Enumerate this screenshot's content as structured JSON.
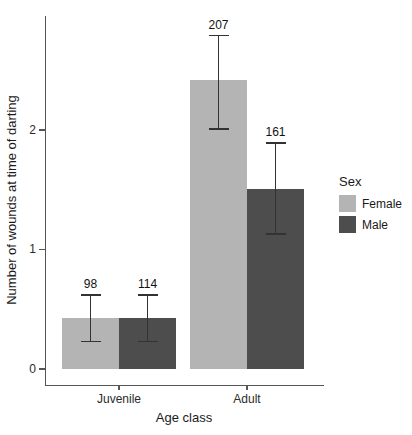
{
  "figure": {
    "width": 412,
    "height": 435,
    "background": "#ffffff"
  },
  "colors": {
    "female_bar": "#b4b4b4",
    "male_bar": "#4d4d4d",
    "axis": "#555555",
    "error_bar": "#333333",
    "text": "#1a1a1a"
  },
  "chart_data": {
    "type": "bar",
    "title": "",
    "xlabel": "Age class",
    "ylabel": "Number of wounds at time of darting",
    "categories": [
      "Juvenile",
      "Adult"
    ],
    "yticks": [
      0,
      1,
      2
    ],
    "ylim": [
      0,
      2.96
    ],
    "grid": false,
    "legend_title": "Sex",
    "legend_position": "right",
    "error_bars": true,
    "series": [
      {
        "name": "Female",
        "color": "#b4b4b4",
        "values": [
          0.43,
          2.42
        ],
        "ci_low": [
          0.23,
          2.01
        ],
        "ci_high": [
          0.62,
          2.79
        ],
        "point_labels": [
          "98",
          "207"
        ]
      },
      {
        "name": "Male",
        "color": "#4d4d4d",
        "values": [
          0.43,
          1.51
        ],
        "ci_low": [
          0.23,
          1.13
        ],
        "ci_high": [
          0.62,
          1.89
        ],
        "point_labels": [
          "114",
          "161"
        ]
      }
    ]
  }
}
